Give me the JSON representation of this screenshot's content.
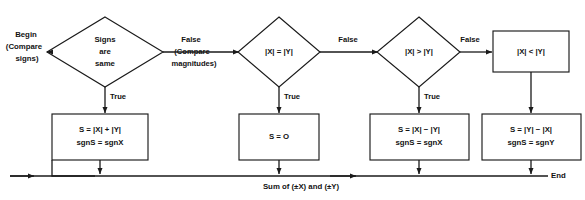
{
  "diagram": {
    "colors": {
      "background": "#ffffff",
      "stroke": "#1a1a1a",
      "text": "#121212",
      "shape_fill": "#ffffff"
    },
    "terminators": {
      "begin_line1": "Begin",
      "begin_line2": "(Compare",
      "begin_line3": "signs)",
      "end": "End"
    },
    "decisions": [
      {
        "id": "signs-same",
        "line1": "Signs",
        "line2": "are",
        "line3": "same",
        "true_label": "True",
        "false_label_line1": "False",
        "false_label_line2": "(Compare",
        "false_label_line3": "magnitudes)"
      },
      {
        "id": "abs-x-eq-abs-y",
        "line1": "|X| = |Y|",
        "true_label": "True",
        "false_label_line1": "False"
      },
      {
        "id": "abs-x-gt-abs-y",
        "line1": "|X| > |Y|",
        "true_label": "True",
        "false_label_line1": "False"
      }
    ],
    "boxes": [
      {
        "id": "abs-x-lt-abs-y",
        "line1": "|X| < |Y|",
        "line2": ""
      },
      {
        "id": "sum-add",
        "line1": "S = |X| + |Y|",
        "line2": "sgnS  =  sgnX"
      },
      {
        "id": "sum-zero",
        "line1": "S = O",
        "line2": ""
      },
      {
        "id": "sum-x-minus-y",
        "line1": "S = |X| − |Y|",
        "line2": "sgnS  =  sgnX"
      },
      {
        "id": "sum-y-minus-x",
        "line1": "S = |Y| − |X|",
        "line2": "sgnS  =  sgnY"
      }
    ],
    "footer": {
      "result_label": "Sum of (±X) and (±Y)"
    }
  }
}
